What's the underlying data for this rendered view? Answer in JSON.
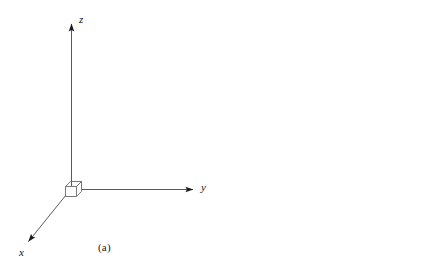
{
  "figure": {
    "background_color": "#ffffff",
    "ink_color": "#1a1a1a",
    "axis_color": "#4a4a4a",
    "panels": [
      {
        "id": "a",
        "caption": "(a)",
        "description": "Right-handed Cartesian coordinate axes with a small cube at the origin",
        "axes": [
          {
            "name": "z",
            "label": "z",
            "direction": "up"
          },
          {
            "name": "y",
            "label": "y",
            "direction": "right"
          },
          {
            "name": "x",
            "label": "x",
            "direction": "down-left"
          }
        ],
        "origin_marker": "cube"
      },
      {
        "id": "b",
        "caption": "(b)",
        "description": "Right hand in a fist with the thumb extended upward, illustrating the right-hand rule for the coordinate axes",
        "axes": [
          {
            "name": "z",
            "label": "z",
            "direction": "up"
          },
          {
            "name": "y",
            "label": "y",
            "direction": "right"
          },
          {
            "name": "x",
            "label": "x",
            "direction": "down-left"
          }
        ],
        "origin_marker": "hand"
      }
    ]
  },
  "panel_a": {
    "caption": "(a)",
    "z_label": "z",
    "y_label": "y",
    "x_label": "x"
  },
  "panel_b": {
    "caption": "(b)",
    "z_label": "z",
    "y_label": "y",
    "x_label": "x"
  }
}
